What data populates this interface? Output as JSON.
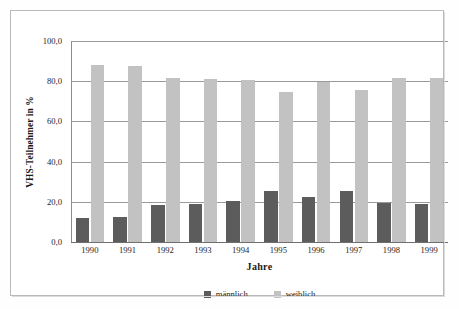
{
  "chart_data": {
    "type": "bar",
    "title": "",
    "xlabel": "Jahre",
    "ylabel": "VHS-Teilnehmer in %",
    "ylim": [
      0,
      100
    ],
    "yticks": [
      "0,0",
      "20,0",
      "40,0",
      "60,0",
      "80,0",
      "100,0"
    ],
    "ytick_values": [
      0,
      20,
      40,
      60,
      80,
      100
    ],
    "grid": "horizontal",
    "legend_position": "bottom-center",
    "categories": [
      "1990",
      "1991",
      "1992",
      "1993",
      "1994",
      "1995",
      "1996",
      "1997",
      "1998",
      "1999"
    ],
    "series": [
      {
        "name": "männlich",
        "color": "#5c5c5c",
        "values": [
          12.0,
          12.5,
          18.5,
          19.0,
          20.5,
          25.5,
          22.5,
          25.5,
          19.5,
          19.0
        ]
      },
      {
        "name": "weiblich",
        "color": "#c2c2c2",
        "values": [
          88.0,
          87.5,
          81.5,
          81.0,
          80.5,
          74.5,
          79.5,
          75.5,
          81.5,
          81.5
        ]
      }
    ]
  },
  "legend": {
    "items": [
      {
        "label": "männlich"
      },
      {
        "label": "weiblich"
      }
    ]
  }
}
